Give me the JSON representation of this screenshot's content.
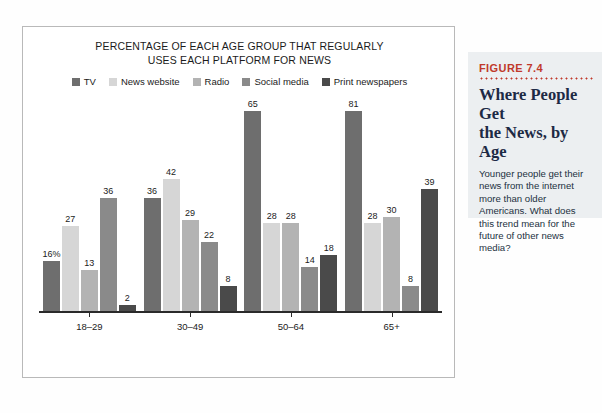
{
  "chart_data": {
    "type": "bar",
    "title": "PERCENTAGE OF EACH AGE GROUP THAT REGULARLY USES EACH PLATFORM FOR NEWS",
    "title_line1": "PERCENTAGE OF EACH AGE GROUP THAT REGULARLY",
    "title_line2": "USES EACH PLATFORM FOR NEWS",
    "xlabel": "",
    "ylabel": "",
    "ylim": [
      0,
      81
    ],
    "grid": false,
    "legend_position": "top-center",
    "categories": [
      "18–29",
      "30–49",
      "50–64",
      "65+"
    ],
    "series": [
      {
        "name": "TV",
        "color": "#6e6e6e",
        "values": [
          16,
          36,
          65,
          81
        ],
        "labels": [
          "16%",
          "36",
          "65",
          "81"
        ]
      },
      {
        "name": "News website",
        "color": "#d6d6d6",
        "values": [
          27,
          42,
          28,
          28
        ],
        "labels": [
          "27",
          "42",
          "28",
          "28"
        ]
      },
      {
        "name": "Radio",
        "color": "#b3b3b3",
        "values": [
          13,
          29,
          28,
          30
        ],
        "labels": [
          "13",
          "29",
          "28",
          "30"
        ]
      },
      {
        "name": "Social media",
        "color": "#8a8a8a",
        "values": [
          36,
          22,
          14,
          8
        ],
        "labels": [
          "36",
          "22",
          "14",
          "8"
        ]
      },
      {
        "name": "Print newspapers",
        "color": "#4a4a4a",
        "values": [
          2,
          8,
          18,
          39
        ],
        "labels": [
          "2",
          "8",
          "18",
          "39"
        ]
      }
    ]
  },
  "figure": {
    "number": "FIGURE 7.4",
    "headline_line1": "Where People Get",
    "headline_line2": "the News, by Age",
    "body": "Younger people get their news from the internet more than older Americans. What does this trend mean for the future of other news media?",
    "accent_color": "#c0392b",
    "headline_color": "#1d2a45",
    "panel_color": "#eceff1"
  }
}
